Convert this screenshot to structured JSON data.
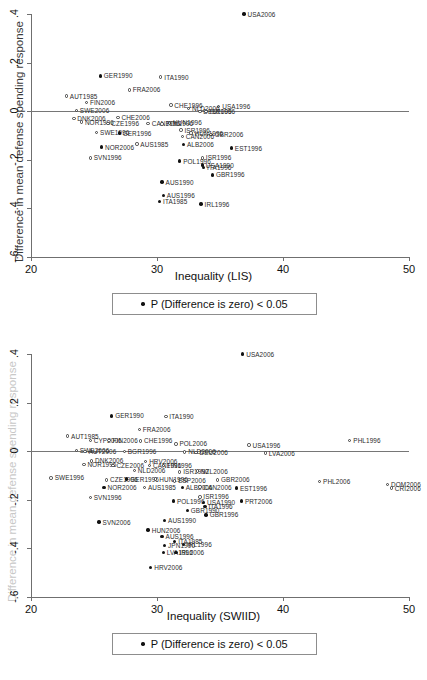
{
  "figure": {
    "legend_label": "P (Difference is zero) < 0.05"
  },
  "panels": [
    {
      "id": "lis",
      "xlabel": "Inequality (LIS)",
      "ylabel": "Difference in mean defense spending response",
      "legend_label": "P (Difference is zero) < 0.05"
    },
    {
      "id": "swiid",
      "xlabel": "Inequality (SWIID)",
      "ylabel": "Difference in mean defense spending response",
      "legend_label": "P (Difference is zero) < 0.05"
    }
  ],
  "chart_data": [
    {
      "type": "scatter",
      "id": "lis",
      "title": "",
      "xlabel": "Inequality (LIS)",
      "ylabel": "Difference in mean defense spending response",
      "xlim": [
        20,
        50
      ],
      "ylim": [
        -0.6,
        0.4
      ],
      "xticks": [
        20,
        30,
        40,
        50
      ],
      "xtick_labels": [
        "20",
        "30",
        "40",
        "50"
      ],
      "yticks": [
        0.4,
        0.2,
        0,
        -0.2,
        -0.4,
        -0.6
      ],
      "ytick_labels": [
        ".4",
        ".2",
        "0",
        "-.2",
        "-.4",
        "-.6"
      ],
      "grid": false,
      "zero_reference_line": 0,
      "legend": {
        "position": "below-axis",
        "entries": [
          "P (Difference is zero) < 0.05"
        ]
      },
      "marker_encoding": {
        "filled": "p < 0.05",
        "hollow": "p >= 0.05"
      },
      "points": [
        {
          "label": "USA2006",
          "x": 36.9,
          "y": 0.4,
          "filled": true
        },
        {
          "label": "GER1990",
          "x": 25.5,
          "y": 0.145,
          "filled": true
        },
        {
          "label": "ITA1990",
          "x": 30.3,
          "y": 0.14,
          "filled": false
        },
        {
          "label": "FRA2006",
          "x": 27.8,
          "y": 0.088,
          "filled": false
        },
        {
          "label": "AUT1985",
          "x": 22.8,
          "y": 0.062,
          "filled": false
        },
        {
          "label": "FIN2006",
          "x": 24.4,
          "y": 0.037,
          "filled": false
        },
        {
          "label": "CHE1996",
          "x": 31.1,
          "y": 0.025,
          "filled": false
        },
        {
          "label": "USA1996",
          "x": 34.9,
          "y": 0.02,
          "filled": false
        },
        {
          "label": "NLD2006",
          "x": 32.5,
          "y": 0.012,
          "filled": false
        },
        {
          "label": "SWE2006",
          "x": 23.6,
          "y": 0.002,
          "filled": false
        },
        {
          "label": "DEU2006",
          "x": 33.4,
          "y": 0.0,
          "filled": false
        },
        {
          "label": "ISR1996",
          "x": 33.9,
          "y": -0.002,
          "filled": false
        },
        {
          "label": "DNK2006",
          "x": 23.4,
          "y": -0.03,
          "filled": false
        },
        {
          "label": "CHE2006",
          "x": 26.9,
          "y": -0.025,
          "filled": false
        },
        {
          "label": "NOR1996",
          "x": 24.0,
          "y": -0.045,
          "filled": false
        },
        {
          "label": "CZE1996",
          "x": 26.1,
          "y": -0.05,
          "filled": false
        },
        {
          "label": "CAN1996",
          "x": 29.3,
          "y": -0.05,
          "filled": false
        },
        {
          "label": "HUN1996",
          "x": 31.0,
          "y": -0.048,
          "filled": false
        },
        {
          "label": "POL1996",
          "x": 30.4,
          "y": -0.052,
          "filled": false
        },
        {
          "label": "ISR1996b",
          "x": 31.9,
          "y": -0.078,
          "filled": false
        },
        {
          "label": "SWE1996",
          "x": 25.2,
          "y": -0.088,
          "filled": false
        },
        {
          "label": "GER1996",
          "x": 27.0,
          "y": -0.09,
          "filled": true
        },
        {
          "label": "HUN1996b",
          "x": 32.7,
          "y": -0.09,
          "filled": false
        },
        {
          "label": "GBR2006",
          "x": 34.3,
          "y": -0.095,
          "filled": false
        },
        {
          "label": "CAN2006",
          "x": 32.0,
          "y": -0.105,
          "filled": false
        },
        {
          "label": "AUS1985",
          "x": 28.4,
          "y": -0.135,
          "filled": false
        },
        {
          "label": "ALB2006",
          "x": 32.1,
          "y": -0.138,
          "filled": true
        },
        {
          "label": "NOR2006",
          "x": 25.6,
          "y": -0.148,
          "filled": true
        },
        {
          "label": "EST1996",
          "x": 35.9,
          "y": -0.152,
          "filled": true
        },
        {
          "label": "SVN1996",
          "x": 24.7,
          "y": -0.192,
          "filled": false
        },
        {
          "label": "ISR1996c",
          "x": 33.6,
          "y": -0.192,
          "filled": false
        },
        {
          "label": "POL1996b",
          "x": 31.8,
          "y": -0.205,
          "filled": true
        },
        {
          "label": "USA1990",
          "x": 33.6,
          "y": -0.222,
          "filled": true
        },
        {
          "label": "ITA1996",
          "x": 33.7,
          "y": -0.232,
          "filled": true
        },
        {
          "label": "GBR1996",
          "x": 34.4,
          "y": -0.262,
          "filled": true
        },
        {
          "label": "AUS1990",
          "x": 30.4,
          "y": -0.292,
          "filled": true
        },
        {
          "label": "AUS1996",
          "x": 30.5,
          "y": -0.348,
          "filled": true
        },
        {
          "label": "ITA1985",
          "x": 30.2,
          "y": -0.372,
          "filled": true
        },
        {
          "label": "IRL1996",
          "x": 33.5,
          "y": -0.382,
          "filled": true
        }
      ]
    },
    {
      "type": "scatter",
      "id": "swiid",
      "title": "",
      "xlabel": "Inequality (SWIID)",
      "ylabel": "Difference in mean defense spending response",
      "xlim": [
        20,
        50
      ],
      "ylim": [
        -0.6,
        0.4
      ],
      "xticks": [
        20,
        30,
        40,
        50
      ],
      "xtick_labels": [
        "20",
        "30",
        "40",
        "50"
      ],
      "yticks": [
        0.4,
        0.2,
        0,
        -0.2,
        -0.4,
        -0.6
      ],
      "ytick_labels": [
        ".4",
        ".2",
        "0",
        "-.2",
        "-.4",
        "-.6"
      ],
      "grid": false,
      "zero_reference_line": 0,
      "legend": {
        "position": "below-axis",
        "entries": [
          "P (Difference is zero) < 0.05"
        ]
      },
      "marker_encoding": {
        "filled": "p < 0.05",
        "hollow": "p >= 0.05"
      },
      "points": [
        {
          "label": "USA2006",
          "x": 36.8,
          "y": 0.4,
          "filled": true
        },
        {
          "label": "GER1990",
          "x": 26.4,
          "y": 0.145,
          "filled": true
        },
        {
          "label": "ITA1990",
          "x": 30.7,
          "y": 0.142,
          "filled": false
        },
        {
          "label": "FRA2006",
          "x": 28.6,
          "y": 0.09,
          "filled": false
        },
        {
          "label": "AUT1985",
          "x": 22.9,
          "y": 0.062,
          "filled": false
        },
        {
          "label": "CYP2006",
          "x": 24.7,
          "y": 0.045,
          "filled": false
        },
        {
          "label": "FIN2006",
          "x": 26.2,
          "y": 0.045,
          "filled": false
        },
        {
          "label": "CHE1996",
          "x": 28.7,
          "y": 0.042,
          "filled": false
        },
        {
          "label": "PHL1996",
          "x": 45.3,
          "y": 0.045,
          "filled": false
        },
        {
          "label": "POL2006",
          "x": 31.5,
          "y": 0.03,
          "filled": false
        },
        {
          "label": "USA1996",
          "x": 37.3,
          "y": 0.025,
          "filled": false
        },
        {
          "label": "SWE2006",
          "x": 23.6,
          "y": 0.002,
          "filled": false
        },
        {
          "label": "AUT2006",
          "x": 24.3,
          "y": 0.0,
          "filled": false
        },
        {
          "label": "BGR1996",
          "x": 27.4,
          "y": -0.002,
          "filled": false
        },
        {
          "label": "NLD2006",
          "x": 32.2,
          "y": -0.003,
          "filled": false
        },
        {
          "label": "DEU2006",
          "x": 33.1,
          "y": -0.005,
          "filled": false
        },
        {
          "label": "LVA2006",
          "x": 38.6,
          "y": -0.008,
          "filled": false
        },
        {
          "label": "DNK2006",
          "x": 24.8,
          "y": -0.04,
          "filled": false
        },
        {
          "label": "HRV2006",
          "x": 29.1,
          "y": -0.042,
          "filled": false
        },
        {
          "label": "NOR1996",
          "x": 24.2,
          "y": -0.055,
          "filled": false
        },
        {
          "label": "CZE2006",
          "x": 26.5,
          "y": -0.058,
          "filled": false
        },
        {
          "label": "CAN1996",
          "x": 29.4,
          "y": -0.058,
          "filled": false
        },
        {
          "label": "FIN1996",
          "x": 30.5,
          "y": -0.06,
          "filled": false
        },
        {
          "label": "NLD2006b",
          "x": 28.2,
          "y": -0.08,
          "filled": false
        },
        {
          "label": "ISR1990",
          "x": 31.8,
          "y": -0.085,
          "filled": false
        },
        {
          "label": "NZL2006",
          "x": 33.2,
          "y": -0.082,
          "filled": false
        },
        {
          "label": "SWE1996",
          "x": 21.6,
          "y": -0.11,
          "filled": false
        },
        {
          "label": "CZE1996",
          "x": 26.0,
          "y": -0.118,
          "filled": false
        },
        {
          "label": "GER1996",
          "x": 27.6,
          "y": -0.115,
          "filled": true
        },
        {
          "label": "HUN1996",
          "x": 29.9,
          "y": -0.115,
          "filled": false
        },
        {
          "label": "ESP2006",
          "x": 31.4,
          "y": -0.122,
          "filled": false
        },
        {
          "label": "GBR2006",
          "x": 34.8,
          "y": -0.118,
          "filled": false
        },
        {
          "label": "PHL2006",
          "x": 42.9,
          "y": -0.125,
          "filled": false
        },
        {
          "label": "DOM2006",
          "x": 48.3,
          "y": -0.138,
          "filled": false
        },
        {
          "label": "CRI2006",
          "x": 48.6,
          "y": -0.152,
          "filled": false
        },
        {
          "label": "NOR2006",
          "x": 25.8,
          "y": -0.15,
          "filled": true
        },
        {
          "label": "AUS1985",
          "x": 29.0,
          "y": -0.15,
          "filled": false
        },
        {
          "label": "ALB2006",
          "x": 32.0,
          "y": -0.15,
          "filled": true
        },
        {
          "label": "CAN2006",
          "x": 33.4,
          "y": -0.148,
          "filled": false
        },
        {
          "label": "EST1996",
          "x": 36.3,
          "y": -0.152,
          "filled": true
        },
        {
          "label": "SVN1996",
          "x": 24.7,
          "y": -0.19,
          "filled": false
        },
        {
          "label": "ISR1996",
          "x": 33.4,
          "y": -0.188,
          "filled": false
        },
        {
          "label": "POL1996",
          "x": 31.3,
          "y": -0.205,
          "filled": true
        },
        {
          "label": "USA1990",
          "x": 33.7,
          "y": -0.212,
          "filled": true
        },
        {
          "label": "ITA1996",
          "x": 33.8,
          "y": -0.228,
          "filled": true
        },
        {
          "label": "PRT2006",
          "x": 36.7,
          "y": -0.205,
          "filled": true
        },
        {
          "label": "GBR1990",
          "x": 32.4,
          "y": -0.245,
          "filled": true
        },
        {
          "label": "GBR1996",
          "x": 33.9,
          "y": -0.262,
          "filled": true
        },
        {
          "label": "AUS1990",
          "x": 30.6,
          "y": -0.285,
          "filled": true
        },
        {
          "label": "SVN2006",
          "x": 25.4,
          "y": -0.292,
          "filled": true
        },
        {
          "label": "HUN2006",
          "x": 29.3,
          "y": -0.325,
          "filled": true
        },
        {
          "label": "AUS1996",
          "x": 30.4,
          "y": -0.352,
          "filled": true
        },
        {
          "label": "ITA1985",
          "x": 31.4,
          "y": -0.372,
          "filled": true
        },
        {
          "label": "IRL1996",
          "x": 32.1,
          "y": -0.385,
          "filled": true
        },
        {
          "label": "JPN1990",
          "x": 30.6,
          "y": -0.388,
          "filled": true
        },
        {
          "label": "LVA1996",
          "x": 30.5,
          "y": -0.418,
          "filled": true
        },
        {
          "label": "IRL2006",
          "x": 31.5,
          "y": -0.418,
          "filled": true
        },
        {
          "label": "HRV2006b",
          "x": 29.5,
          "y": -0.478,
          "filled": true
        }
      ]
    }
  ]
}
